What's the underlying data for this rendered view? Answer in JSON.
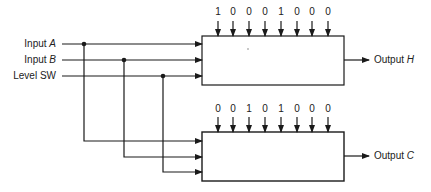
{
  "inputs": [
    {
      "name": "Input",
      "var": "A",
      "y": 44
    },
    {
      "name": "Input",
      "var": "B",
      "y": 60
    },
    {
      "name": "Level SW",
      "var": "",
      "y": 76
    }
  ],
  "top_block": {
    "bits": [
      "1",
      "0",
      "0",
      "0",
      "1",
      "0",
      "0",
      "0"
    ],
    "output_label": "Output",
    "output_var": "H"
  },
  "bottom_block": {
    "bits": [
      "0",
      "0",
      "1",
      "0",
      "1",
      "0",
      "0",
      "0"
    ],
    "output_label": "Output",
    "output_var": "C"
  },
  "colors": {
    "line": "#1a1a1a",
    "background": "#ffffff"
  }
}
